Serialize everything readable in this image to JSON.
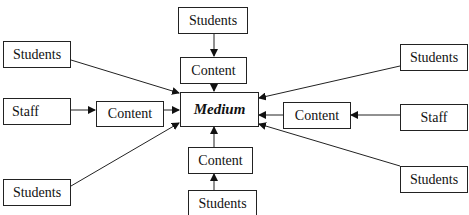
{
  "diagram": {
    "center": {
      "label": "Medium"
    },
    "nodes": {
      "top_students": {
        "label": "Students"
      },
      "top_content": {
        "label": "Content"
      },
      "left_students": {
        "label": "Students"
      },
      "left_staff": {
        "label": "Staff"
      },
      "left_content": {
        "label": "Content"
      },
      "bottom_left_students": {
        "label": "Students"
      },
      "bottom_content": {
        "label": "Content"
      },
      "bottom_students": {
        "label": "Students"
      },
      "right_top_students": {
        "label": "Students"
      },
      "right_content": {
        "label": "Content"
      },
      "right_staff": {
        "label": "Staff"
      },
      "right_bottom_students": {
        "label": "Students"
      }
    },
    "edges": [
      {
        "from": "top_students",
        "to": "top_content"
      },
      {
        "from": "top_content",
        "to": "Medium"
      },
      {
        "from": "left_students",
        "to": "Medium"
      },
      {
        "from": "left_staff",
        "to": "left_content"
      },
      {
        "from": "left_content",
        "to": "Medium"
      },
      {
        "from": "bottom_left_students",
        "to": "Medium"
      },
      {
        "from": "bottom_students",
        "to": "bottom_content"
      },
      {
        "from": "bottom_content",
        "to": "Medium"
      },
      {
        "from": "right_top_students",
        "to": "Medium"
      },
      {
        "from": "right_staff",
        "to": "right_content"
      },
      {
        "from": "right_content",
        "to": "Medium"
      },
      {
        "from": "right_bottom_students",
        "to": "Medium"
      }
    ]
  }
}
